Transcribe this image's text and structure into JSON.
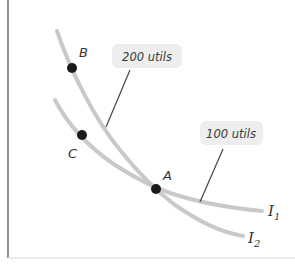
{
  "diagram": {
    "type": "indifference-curves",
    "colors": {
      "curve": "#c9c9c9",
      "point": "#1a1a1a",
      "axis": "#555555",
      "bottom_edge": "#e6e6e6",
      "callout_bg": "#eeeeee",
      "pointer": "#444444",
      "text": "#333333"
    },
    "curves": [
      {
        "id": "I1",
        "name": "I",
        "subscript": "1",
        "utility_label": "100 utils"
      },
      {
        "id": "I2",
        "name": "I",
        "subscript": "2",
        "utility_label": "200 utils"
      }
    ],
    "points": [
      {
        "label": "A"
      },
      {
        "label": "B"
      },
      {
        "label": "C"
      }
    ],
    "callouts": {
      "upper": "200 utils",
      "lower": "100 utils"
    }
  }
}
